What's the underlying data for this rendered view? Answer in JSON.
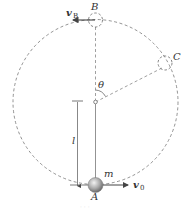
{
  "figure": {
    "labels": {
      "point_top": "B",
      "point_side": "C",
      "point_bottom": "A",
      "mass": "m",
      "angle": "θ",
      "length": "l",
      "velocity_bottom": "v",
      "velocity_bottom_sub": "0",
      "velocity_top": "v",
      "velocity_top_sub": "B"
    },
    "colors": {
      "line": "#555555",
      "dashed": "#777777",
      "ball": "#9a9a9a",
      "text": "#333333"
    },
    "caption": "· · ·"
  }
}
